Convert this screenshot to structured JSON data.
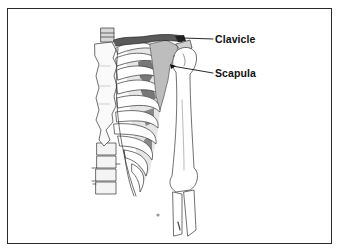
{
  "diagram": {
    "labels": [
      {
        "id": "clavicle",
        "text": "Clavicle"
      },
      {
        "id": "scapula",
        "text": "Scapula"
      }
    ],
    "colors": {
      "border": "#2a2a2a",
      "ink": "#222222",
      "shade_dark": "#555555",
      "shade_light": "#bdbdbd",
      "background": "#ffffff"
    }
  }
}
